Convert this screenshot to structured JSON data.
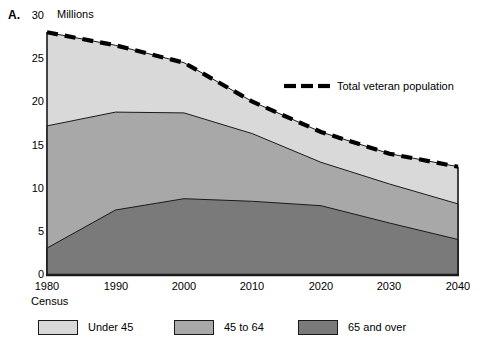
{
  "panel": {
    "letter": "A.",
    "unit_label": "Millions"
  },
  "axes": {
    "y_ticks": [
      "0",
      "5",
      "10",
      "15",
      "20",
      "25",
      "30"
    ],
    "x_ticks": [
      "1980",
      "1990",
      "2000",
      "2010",
      "2020",
      "2030",
      "2040"
    ],
    "x_sub_label": "Census"
  },
  "annotation": {
    "total_line_label": "Total veteran population"
  },
  "legend": {
    "items": [
      {
        "label": "Under 45",
        "color": "#d9d9d9"
      },
      {
        "label": "45 to 64",
        "color": "#a8a8a8"
      },
      {
        "label": "65 and over",
        "color": "#7a7a7a"
      }
    ]
  },
  "colors": {
    "under45": "#d9d9d9",
    "age45to64": "#a8a8a8",
    "age65plus": "#7a7a7a",
    "outline": "#1a1a1a",
    "total_line": "#000000",
    "background": "#ffffff"
  },
  "chart_data": {
    "type": "area",
    "title": "",
    "subtitle": "",
    "xlabel": "Census",
    "ylabel": "Millions",
    "xlim": [
      1980,
      2040
    ],
    "ylim": [
      0,
      30
    ],
    "grid": false,
    "legend_position": "bottom",
    "stacked": true,
    "x": [
      1980,
      1990,
      2000,
      2010,
      2020,
      2030,
      2040
    ],
    "series": [
      {
        "name": "65 and over",
        "values": [
          3.1,
          7.5,
          8.8,
          8.5,
          8.0,
          6.0,
          4.1
        ]
      },
      {
        "name": "45 to 64",
        "values": [
          14.1,
          11.3,
          9.9,
          7.8,
          5.0,
          4.5,
          4.1
        ]
      },
      {
        "name": "Under 45",
        "values": [
          10.8,
          7.7,
          5.8,
          3.7,
          3.5,
          3.5,
          4.3
        ]
      }
    ],
    "cumulative_boundaries": {
      "age65plus_top": [
        3.1,
        7.5,
        8.8,
        8.5,
        8.0,
        6.0,
        4.1
      ],
      "age45to64_top": [
        17.2,
        18.8,
        18.7,
        16.3,
        13.0,
        10.5,
        8.2
      ],
      "under45_top": [
        28.0,
        26.5,
        24.5,
        20.0,
        16.5,
        14.0,
        12.5
      ]
    },
    "annotations": [
      {
        "name": "total-veteran-population",
        "text": "Total veteran population",
        "style": "dashed-line",
        "values": [
          28.0,
          26.5,
          24.5,
          20.0,
          16.5,
          14.0,
          12.5
        ]
      }
    ]
  }
}
